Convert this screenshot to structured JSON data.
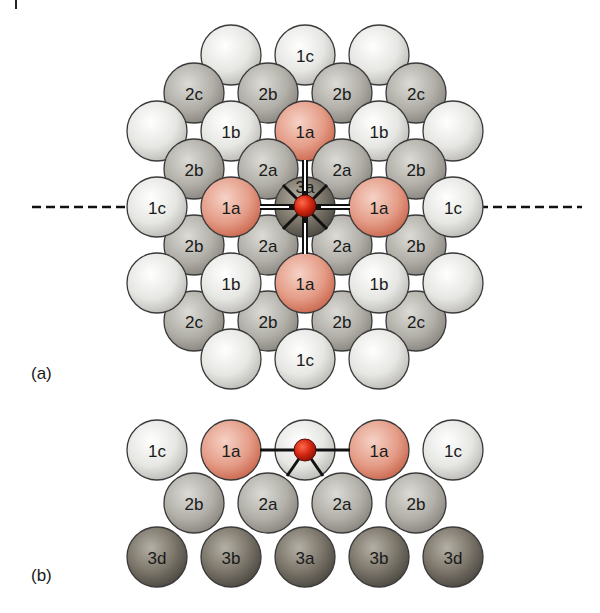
{
  "figure": {
    "panel_a_label": "(a)",
    "panel_b_label": "(b)",
    "colors": {
      "adsorbate": "#c8200e",
      "first_layer_white": "#eeeeec",
      "first_layer_a_pink": "#e9a592",
      "second_layer_gray": "#b3b1aa",
      "third_layer_dark": "#7d776c",
      "outline": "#3a3a3a",
      "bond": "#111111"
    },
    "panel_a": {
      "atom_radius": 30,
      "dashed_line": {
        "y": 207,
        "left_x1": 32,
        "left_x2": 148,
        "right_x1": 465,
        "right_x2": 582
      },
      "atoms": [
        {
          "x": 231,
          "y": 55,
          "label": "",
          "kind": "white"
        },
        {
          "x": 305,
          "y": 55,
          "label": "1c",
          "kind": "white"
        },
        {
          "x": 379,
          "y": 55,
          "label": "",
          "kind": "white"
        },
        {
          "x": 194,
          "y": 93,
          "label": "2c",
          "kind": "gray"
        },
        {
          "x": 268,
          "y": 93,
          "label": "2b",
          "kind": "gray"
        },
        {
          "x": 342,
          "y": 93,
          "label": "2b",
          "kind": "gray"
        },
        {
          "x": 416,
          "y": 93,
          "label": "2c",
          "kind": "gray"
        },
        {
          "x": 157,
          "y": 131,
          "label": "",
          "kind": "white"
        },
        {
          "x": 231,
          "y": 131,
          "label": "1b",
          "kind": "white"
        },
        {
          "x": 305,
          "y": 131,
          "label": "1a",
          "kind": "pink"
        },
        {
          "x": 379,
          "y": 131,
          "label": "1b",
          "kind": "white"
        },
        {
          "x": 453,
          "y": 131,
          "label": "",
          "kind": "white"
        },
        {
          "x": 194,
          "y": 169,
          "label": "2b",
          "kind": "gray"
        },
        {
          "x": 268,
          "y": 169,
          "label": "2a",
          "kind": "gray"
        },
        {
          "x": 342,
          "y": 169,
          "label": "2a",
          "kind": "gray"
        },
        {
          "x": 416,
          "y": 169,
          "label": "2b",
          "kind": "gray"
        },
        {
          "x": 194,
          "y": 245,
          "label": "2b",
          "kind": "gray"
        },
        {
          "x": 268,
          "y": 245,
          "label": "2a",
          "kind": "gray"
        },
        {
          "x": 342,
          "y": 245,
          "label": "2a",
          "kind": "gray"
        },
        {
          "x": 416,
          "y": 245,
          "label": "2b",
          "kind": "gray"
        },
        {
          "x": 305,
          "y": 207,
          "label": "",
          "kind": "dark"
        },
        {
          "x": 157,
          "y": 207,
          "label": "1c",
          "kind": "white"
        },
        {
          "x": 231,
          "y": 207,
          "label": "1a",
          "kind": "pink"
        },
        {
          "x": 379,
          "y": 207,
          "label": "1a",
          "kind": "pink"
        },
        {
          "x": 453,
          "y": 207,
          "label": "1c",
          "kind": "white"
        },
        {
          "x": 194,
          "y": 321,
          "label": "2c",
          "kind": "gray"
        },
        {
          "x": 268,
          "y": 321,
          "label": "2b",
          "kind": "gray"
        },
        {
          "x": 342,
          "y": 321,
          "label": "2b",
          "kind": "gray"
        },
        {
          "x": 416,
          "y": 321,
          "label": "2c",
          "kind": "gray"
        },
        {
          "x": 157,
          "y": 283,
          "label": "",
          "kind": "white"
        },
        {
          "x": 231,
          "y": 283,
          "label": "1b",
          "kind": "white"
        },
        {
          "x": 305,
          "y": 283,
          "label": "1a",
          "kind": "pink"
        },
        {
          "x": 379,
          "y": 283,
          "label": "1b",
          "kind": "white"
        },
        {
          "x": 453,
          "y": 283,
          "label": "",
          "kind": "white"
        },
        {
          "x": 231,
          "y": 359,
          "label": "",
          "kind": "white"
        },
        {
          "x": 305,
          "y": 359,
          "label": "1c",
          "kind": "white"
        },
        {
          "x": 379,
          "y": 359,
          "label": "",
          "kind": "white"
        }
      ],
      "center": {
        "x": 305,
        "y": 207,
        "under_label": "3a",
        "adsorbate_radius": 11
      }
    },
    "panel_b": {
      "atom_radius": 30,
      "atoms": [
        {
          "x": 157,
          "y": 450,
          "label": "1c",
          "kind": "white"
        },
        {
          "x": 231,
          "y": 450,
          "label": "1a",
          "kind": "pink"
        },
        {
          "x": 305,
          "y": 450,
          "label": "",
          "kind": "white"
        },
        {
          "x": 379,
          "y": 450,
          "label": "1a",
          "kind": "pink"
        },
        {
          "x": 453,
          "y": 450,
          "label": "1c",
          "kind": "white"
        },
        {
          "x": 194,
          "y": 503,
          "label": "2b",
          "kind": "gray"
        },
        {
          "x": 268,
          "y": 503,
          "label": "2a",
          "kind": "gray"
        },
        {
          "x": 342,
          "y": 503,
          "label": "2a",
          "kind": "gray"
        },
        {
          "x": 416,
          "y": 503,
          "label": "2b",
          "kind": "gray"
        },
        {
          "x": 157,
          "y": 557,
          "label": "3d",
          "kind": "dark"
        },
        {
          "x": 231,
          "y": 557,
          "label": "3b",
          "kind": "dark"
        },
        {
          "x": 305,
          "y": 557,
          "label": "3a",
          "kind": "dark"
        },
        {
          "x": 379,
          "y": 557,
          "label": "3b",
          "kind": "dark"
        },
        {
          "x": 453,
          "y": 557,
          "label": "3d",
          "kind": "dark"
        }
      ],
      "adsorbate": {
        "x": 305,
        "y": 450,
        "r": 11
      }
    }
  }
}
